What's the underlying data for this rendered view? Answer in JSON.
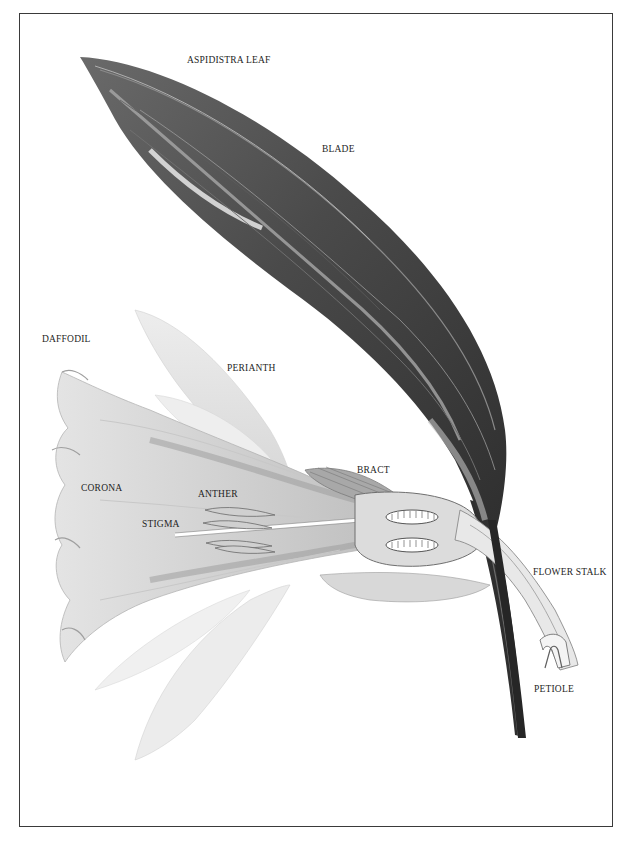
{
  "plate": {
    "frame_color": "#3a3a3a",
    "background": "#ffffff"
  },
  "specimens": [
    {
      "name": "aspidistra-leaf",
      "title": "ASPIDISTRA LEAF",
      "parts": [
        "BLADE",
        "PETIOLE"
      ]
    },
    {
      "name": "daffodil",
      "title": "DAFFODIL",
      "parts": [
        "PERIANTH",
        "BRACT",
        "CORONA",
        "ANTHER",
        "STIGMA",
        "FLOWER STALK"
      ]
    }
  ],
  "labels": {
    "aspidistra_leaf": "ASPIDISTRA LEAF",
    "blade": "BLADE",
    "daffodil": "DAFFODIL",
    "perianth": "PERIANTH",
    "bract": "BRACT",
    "corona": "CORONA",
    "anther": "ANTHER",
    "stigma": "STIGMA",
    "flower_stalk": "FLOWER STALK",
    "petiole": "PETIOLE"
  },
  "colors": {
    "leaf_dark": "#3c3c3c",
    "leaf_mid": "#7a7a7a",
    "leaf_light": "#c4c4c4",
    "flower_light": "#e6e6e6",
    "flower_mid": "#bdbdbd",
    "flower_shadow": "#8f8f8f",
    "label_text": "#1e1e1e"
  }
}
